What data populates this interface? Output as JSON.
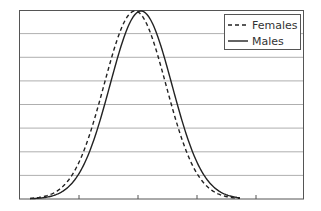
{
  "chart_data": {
    "type": "line",
    "title": "",
    "xlabel": "",
    "ylabel": "",
    "grid": {
      "horizontal": true,
      "vertical": false,
      "horizontal_lines": 8
    },
    "x_ticks": 4,
    "legend": {
      "position": "top-right",
      "entries": [
        {
          "label": "Females",
          "style": "dashed"
        },
        {
          "label": "Males",
          "style": "solid"
        }
      ]
    },
    "series": [
      {
        "name": "Females",
        "style": "dashed",
        "distribution": "normal",
        "mean_px": 135,
        "sd_px": 31
      },
      {
        "name": "Males",
        "style": "solid",
        "distribution": "normal",
        "mean_px": 141,
        "sd_px": 31
      }
    ],
    "plot_area": {
      "left": 19,
      "top": 10,
      "right": 304,
      "bottom": 199
    },
    "colors": {
      "line": "#222222",
      "grid": "#9a9a9a",
      "border": "#555555"
    }
  },
  "legend": {
    "females": "Females",
    "males": "Males"
  }
}
